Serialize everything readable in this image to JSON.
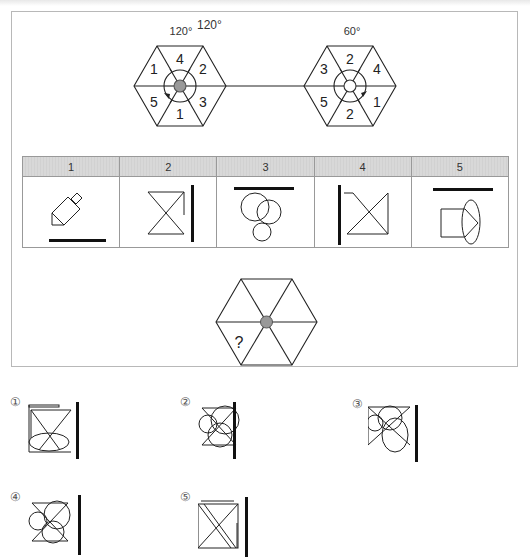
{
  "puzzle": {
    "top_hexagons": [
      {
        "rotation_label": "120°",
        "segments": {
          "top": "4",
          "upper_right": "2",
          "lower_right": "3",
          "bottom": "1",
          "lower_left": "5",
          "upper_left": "1"
        },
        "center": "filled",
        "arrow_direction": "counterclockwise"
      },
      {
        "rotation_label": "60°",
        "segments": {
          "top": "2",
          "upper_right": "4",
          "lower_right": "1",
          "bottom": "2",
          "lower_left": "5",
          "upper_left": "3"
        },
        "center": "empty",
        "arrow_direction": "clockwise"
      }
    ],
    "rule_table": {
      "headers": [
        "1",
        "2",
        "3",
        "4",
        "5"
      ],
      "cells": [
        {
          "name": "pencil-shape-with-bottom-bar"
        },
        {
          "name": "hourglass-with-right-bar"
        },
        {
          "name": "three-circles-with-top-bar"
        },
        {
          "name": "bowtie-with-left-bar"
        },
        {
          "name": "house-ellipse-with-top-bar"
        }
      ]
    },
    "question_hexagon": {
      "mark": "?"
    },
    "answer_options": [
      {
        "label": "①"
      },
      {
        "label": "②"
      },
      {
        "label": "③"
      },
      {
        "label": "④"
      },
      {
        "label": "⑤"
      }
    ]
  }
}
